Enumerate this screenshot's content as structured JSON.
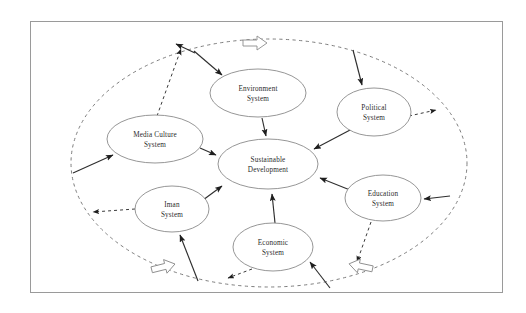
{
  "diagram": {
    "frame": {
      "border_color": "#9a9a9a"
    },
    "boundary": {
      "name": "system-boundary",
      "style": "dashed-ellipse",
      "color": "#7d7d7d"
    },
    "center_node": {
      "id": "sustainable-development",
      "line1": "Sustainable",
      "line2": "Development",
      "cx": 268,
      "cy": 164,
      "rx": 50,
      "ry": 25
    },
    "nodes": [
      {
        "id": "environment-system",
        "line1": "Environment",
        "line2": "System",
        "cx": 258,
        "cy": 93,
        "rx": 48,
        "ry": 24
      },
      {
        "id": "political-system",
        "line1": "Political",
        "line2": "System",
        "cx": 374,
        "cy": 112,
        "rx": 37,
        "ry": 24
      },
      {
        "id": "media-culture-system",
        "line1": "Media Culture",
        "line2": "System",
        "cx": 155,
        "cy": 139,
        "rx": 48,
        "ry": 24
      },
      {
        "id": "education-system",
        "line1": "Education",
        "line2": "System",
        "cx": 383,
        "cy": 198,
        "rx": 38,
        "ry": 23
      },
      {
        "id": "iman-system",
        "line1": "Iman",
        "line2": "System",
        "cx": 172,
        "cy": 209,
        "rx": 37,
        "ry": 23
      },
      {
        "id": "economic-system",
        "line1": "Economic",
        "line2": "System",
        "cx": 273,
        "cy": 247,
        "rx": 40,
        "ry": 24
      }
    ],
    "block_arrows": [
      {
        "id": "block-arrow-top",
        "direction": "right",
        "x": 243,
        "y": 36,
        "rotation": 0
      },
      {
        "id": "block-arrow-bottom-left",
        "direction": "right",
        "x": 150,
        "y": 263,
        "rotation": -14
      },
      {
        "id": "block-arrow-bottom-right",
        "direction": "left",
        "x": 350,
        "y": 262,
        "rotation": 12
      }
    ],
    "connections": [
      {
        "from": "environment-system",
        "to": "sustainable-development",
        "style": "solid"
      },
      {
        "from": "political-system",
        "to": "sustainable-development",
        "style": "solid"
      },
      {
        "from": "media-culture-system",
        "to": "sustainable-development",
        "style": "solid"
      },
      {
        "from": "education-system",
        "to": "sustainable-development",
        "style": "solid"
      },
      {
        "from": "iman-system",
        "to": "sustainable-development",
        "style": "solid"
      },
      {
        "from": "economic-system",
        "to": "sustainable-development",
        "style": "solid"
      },
      {
        "from": "boundary",
        "to": "environment-system",
        "style": "solid"
      },
      {
        "from": "boundary",
        "to": "media-culture-system",
        "style": "solid"
      },
      {
        "from": "boundary",
        "to": "education-system",
        "style": "solid"
      },
      {
        "from": "boundary",
        "to": "economic-system",
        "style": "solid"
      },
      {
        "from": "boundary",
        "to": "political-system",
        "style": "solid"
      },
      {
        "from": "boundary",
        "to": "iman-system",
        "style": "solid"
      },
      {
        "from": "media-culture-system",
        "to": "boundary",
        "style": "dashed"
      },
      {
        "from": "political-system",
        "to": "boundary",
        "style": "dashed"
      },
      {
        "from": "education-system",
        "to": "boundary",
        "style": "dashed"
      },
      {
        "from": "economic-system",
        "to": "boundary",
        "style": "dashed"
      },
      {
        "from": "iman-system",
        "to": "boundary",
        "style": "dashed"
      }
    ]
  }
}
